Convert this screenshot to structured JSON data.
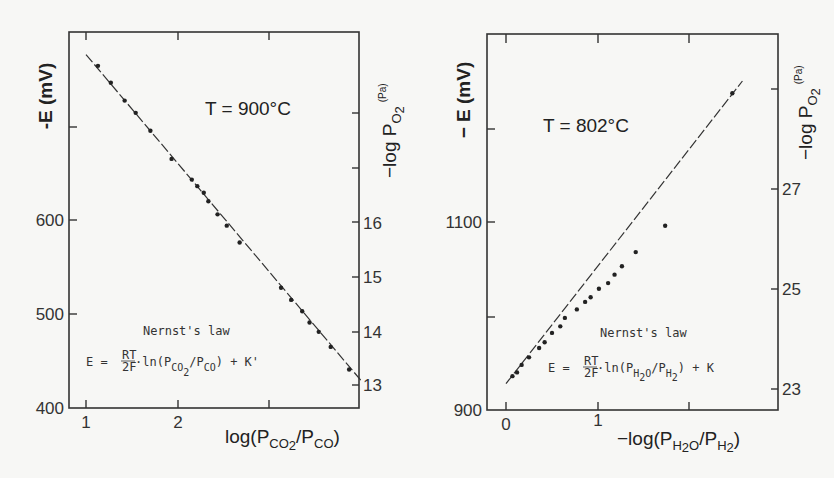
{
  "chart_data": [
    {
      "type": "scatter",
      "title": "T = 900°C",
      "annotation_title": "Nernst's law",
      "annotation_formula": "E = RT/2F · ln(P_CO2/P_CO) + K'",
      "xlabel": "log(P_CO2/P_CO)",
      "ylabel": "-E (mV)",
      "y2label": "-log P_O2 (Pa)",
      "xlim": [
        0.83,
        4.0
      ],
      "ylim": [
        400,
        800
      ],
      "xticks": [
        1,
        2,
        3
      ],
      "xticklabels": [
        "1",
        "2",
        ""
      ],
      "yticks": [
        400,
        500,
        600,
        700
      ],
      "yticklabels": [
        "400",
        "500",
        "600",
        ""
      ],
      "y2ticks": [
        13,
        14,
        15,
        16,
        17,
        18
      ],
      "y2ticklabels": [
        "13",
        "14",
        "15",
        "16",
        "",
        ""
      ],
      "grid": false,
      "fit_line": {
        "x": [
          1.0,
          4.0
        ],
        "y": [
          776,
          428
        ]
      },
      "series": [
        {
          "name": "measured",
          "x": [
            1.13,
            1.27,
            1.42,
            1.54,
            1.7,
            1.93,
            2.15,
            2.21,
            2.28,
            2.33,
            2.43,
            2.53,
            2.67,
            3.12,
            3.23,
            3.35,
            3.43,
            3.53,
            3.66,
            3.86
          ],
          "y": [
            764,
            746,
            727,
            714,
            695,
            665,
            643,
            636,
            629,
            620,
            606,
            594,
            576,
            528,
            515,
            503,
            491,
            481,
            465,
            441
          ]
        }
      ]
    },
    {
      "type": "scatter",
      "title": "T = 802°C",
      "annotation_title": "Nernst's law",
      "annotation_formula": "E = RT/2F · ln(P_H2O/P_H2) + K",
      "xlabel": "-log(P_H2O/P_H2)",
      "ylabel": "- E (mV)",
      "y2label": "-log P_O2 (Pa)",
      "xlim": [
        -0.2,
        2.95
      ],
      "ylim": [
        900,
        1300
      ],
      "xticks": [
        0,
        1,
        2
      ],
      "xticklabels": [
        "0",
        "1",
        ""
      ],
      "yticks": [
        900,
        1000,
        1100,
        1200
      ],
      "yticklabels": [
        "900",
        "",
        "1100",
        ""
      ],
      "y2ticks": [
        23,
        25,
        27,
        29
      ],
      "y2ticklabels": [
        "23",
        "25",
        "27",
        ""
      ],
      "grid": false,
      "fit_line": {
        "x": [
          0.0,
          2.57
        ],
        "y": [
          928,
          1250
        ]
      },
      "series": [
        {
          "name": "measured",
          "x": [
            0.07,
            0.12,
            0.17,
            0.25,
            0.36,
            0.42,
            0.5,
            0.59,
            0.64,
            0.77,
            0.86,
            0.92,
            1.01,
            1.11,
            1.18,
            1.26,
            1.41,
            1.73,
            2.46
          ],
          "y": [
            936,
            940,
            948,
            956,
            966,
            972,
            982,
            989,
            998,
            1007,
            1015,
            1020,
            1029,
            1035,
            1044,
            1053,
            1068,
            1096,
            1237
          ]
        }
      ]
    }
  ],
  "left": {
    "temp": "T = 900°C",
    "ylabel": "-E (mV)",
    "y2label_main": "−log P",
    "y2label_sub": "O",
    "y2label_sub2": "2",
    "y2label_unit": "(Pa)",
    "xlabel_main": "log(P",
    "xlabel_sub1": "CO",
    "xlabel_sub2": "2",
    "xlabel_mid": "/P",
    "xlabel_sub3": "CO",
    "xlabel_end": ")",
    "law_title": "Nernst's law",
    "formula_left": "E = ",
    "formula_num": "RT",
    "formula_den": "2F",
    "formula_ln": "·ln(P",
    "formula_sub1": "CO",
    "formula_sub1b": "2",
    "formula_mid": "/P",
    "formula_sub2": "CO",
    "formula_end": ") + K'",
    "xticks": [
      "1",
      "2"
    ],
    "yticks": [
      "600",
      "500",
      "400"
    ],
    "y2ticks": [
      "16",
      "15",
      "14",
      "13"
    ]
  },
  "right": {
    "temp": "T = 802°C",
    "ylabel": "− E (mV)",
    "y2label_main": "−log P",
    "y2label_sub": "O",
    "y2label_sub2": "2",
    "y2label_unit": "(Pa)",
    "xlabel_main": "−log(P",
    "xlabel_sub1": "H",
    "xlabel_sub1b": "2",
    "xlabel_sub1c": "O",
    "xlabel_mid": "/P",
    "xlabel_sub2": "H",
    "xlabel_sub2b": "2",
    "xlabel_end": ")",
    "law_title": "Nernst's law",
    "formula_left": "E = ",
    "formula_num": "RT",
    "formula_den": "2F",
    "formula_ln": "·ln(P",
    "formula_sub1": "H",
    "formula_sub1b": "2",
    "formula_sub1c": "O",
    "formula_mid": "/P",
    "formula_sub2": "H",
    "formula_sub2b": "2",
    "formula_end": ") + K",
    "xticks": [
      "0",
      "1"
    ],
    "yticks": [
      "1100",
      "900"
    ],
    "y2ticks": [
      "27",
      "25",
      "23"
    ]
  }
}
